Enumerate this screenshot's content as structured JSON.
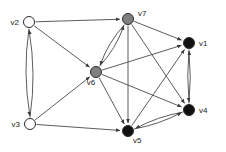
{
  "figure": {
    "type": "directed-graph",
    "background_color": "#ffffff",
    "edge_color": "#4a4a4a",
    "label_color": "#1a1a1a"
  },
  "nodes": [
    {
      "id": "v1",
      "label": "v1",
      "x": 189,
      "y": 43,
      "r": 5.5,
      "fill": "#111111",
      "stroke": "#2b2b2b",
      "color_class": "black",
      "label_x": 199,
      "label_y": 46,
      "label_anchor": "start"
    },
    {
      "id": "v2",
      "label": "v2",
      "x": 29,
      "y": 22,
      "r": 5.5,
      "fill": "#ffffff",
      "stroke": "#2b2b2b",
      "color_class": "white",
      "label_x": 19,
      "label_y": 25,
      "label_anchor": "end"
    },
    {
      "id": "v3",
      "label": "v3",
      "x": 30,
      "y": 124,
      "r": 5.5,
      "fill": "#ffffff",
      "stroke": "#2b2b2b",
      "color_class": "white",
      "label_x": 20,
      "label_y": 127,
      "label_anchor": "end"
    },
    {
      "id": "v4",
      "label": "v4",
      "x": 189,
      "y": 110,
      "r": 5.5,
      "fill": "#111111",
      "stroke": "#2b2b2b",
      "color_class": "black",
      "label_x": 199,
      "label_y": 113,
      "label_anchor": "start"
    },
    {
      "id": "v5",
      "label": "v5",
      "x": 128,
      "y": 131,
      "r": 5.5,
      "fill": "#111111",
      "stroke": "#2b2b2b",
      "color_class": "black",
      "label_x": 133,
      "label_y": 143,
      "label_anchor": "start"
    },
    {
      "id": "v6",
      "label": "v6",
      "x": 96,
      "y": 72,
      "r": 5.5,
      "fill": "#808080",
      "stroke": "#2b2b2b",
      "color_class": "gray",
      "label_x": 91,
      "label_y": 85,
      "label_anchor": "middle"
    },
    {
      "id": "v7",
      "label": "v7",
      "x": 128,
      "y": 19,
      "r": 5.5,
      "fill": "#808080",
      "stroke": "#2b2b2b",
      "color_class": "gray",
      "label_x": 138,
      "label_y": 16,
      "label_anchor": "start"
    }
  ],
  "edges": [
    {
      "from": "v2",
      "to": "v7",
      "curve": 0,
      "arrow": "end"
    },
    {
      "from": "v2",
      "to": "v6",
      "curve": 0,
      "arrow": "end"
    },
    {
      "from": "v2",
      "to": "v3",
      "curve": 7,
      "arrow": "end"
    },
    {
      "from": "v3",
      "to": "v2",
      "curve": 7,
      "arrow": "end"
    },
    {
      "from": "v3",
      "to": "v6",
      "curve": 0,
      "arrow": "end"
    },
    {
      "from": "v3",
      "to": "v5",
      "curve": 0,
      "arrow": "end"
    },
    {
      "from": "v6",
      "to": "v7",
      "curve": 5,
      "arrow": "end"
    },
    {
      "from": "v7",
      "to": "v6",
      "curve": 5,
      "arrow": "end"
    },
    {
      "from": "v6",
      "to": "v1",
      "curve": 0,
      "arrow": "end"
    },
    {
      "from": "v6",
      "to": "v4",
      "curve": 0,
      "arrow": "end"
    },
    {
      "from": "v6",
      "to": "v5",
      "curve": 0,
      "arrow": "end"
    },
    {
      "from": "v7",
      "to": "v1",
      "curve": 0,
      "arrow": "end"
    },
    {
      "from": "v7",
      "to": "v4",
      "curve": 0,
      "arrow": "end"
    },
    {
      "from": "v7",
      "to": "v5",
      "curve": 0,
      "arrow": "end"
    },
    {
      "from": "v5",
      "to": "v1",
      "curve": 0,
      "arrow": "end"
    },
    {
      "from": "v4",
      "to": "v5",
      "curve": 4,
      "arrow": "end"
    },
    {
      "from": "v5",
      "to": "v4",
      "curve": 4,
      "arrow": "end"
    },
    {
      "from": "v1",
      "to": "v4",
      "curve": 2.5,
      "arrow": "end"
    },
    {
      "from": "v4",
      "to": "v1",
      "curve": 2.5,
      "arrow": "end"
    }
  ]
}
